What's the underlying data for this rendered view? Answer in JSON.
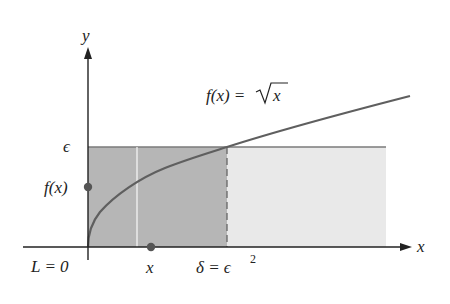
{
  "diagram": {
    "function_label": "f(x) = √x",
    "function_label_lhs": "f(x) = ",
    "function_label_rhs": "x",
    "y_axis_label": "y",
    "x_axis_label": "x",
    "epsilon_label": "ϵ",
    "fx_label": "f(x)",
    "L_label": "L = 0",
    "x_point_label": "x",
    "delta_label_lhs": "δ = ϵ",
    "delta_label_exp": "2",
    "colors": {
      "curve": "#5a5a5a",
      "axis": "#222222",
      "dark_region": "#b4b4b4",
      "light_region": "#e8e8e8",
      "point": "#555555",
      "epsilon_line": "#7a7a7a"
    }
  }
}
